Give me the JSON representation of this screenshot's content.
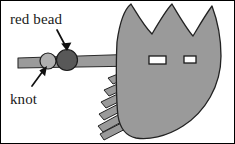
{
  "figure": {
    "type": "line-art-diagram",
    "width": 235,
    "height": 144,
    "background_color": "#ffffff",
    "border_color": "#000000"
  },
  "labels": {
    "red_bead": "red bead",
    "knot": "knot"
  },
  "colors": {
    "fan_fill": "#9a9a9a",
    "fan_stroke": "#222222",
    "shaft_fill": "#9b9b9b",
    "shaft_stroke": "#2a2a2a",
    "bead_fill": "#585858",
    "bead_stroke": "#1c1c1c",
    "knot_fill": "#b0b0b0",
    "knot_stroke": "#1c1c1c",
    "fringe_fill": "#9a9a9a",
    "fringe_stroke": "#242424",
    "slot_fill": "#ffffff",
    "slot_stroke": "#1a1a1a",
    "arrow_color": "#111111",
    "text_color": "#1a1a1a"
  },
  "parts": {
    "fan": {
      "name": "feathered fan body",
      "peak_count": 3
    },
    "shaft": {
      "name": "shaft",
      "from_x": 18,
      "to_x": 140
    },
    "bead": {
      "name": "red bead",
      "cx": 66,
      "cy": 61,
      "r": 10
    },
    "knot": {
      "name": "knot",
      "cx": 48,
      "cy": 61,
      "r": 8
    },
    "slots": [
      {
        "name": "large-slot",
        "x": 149,
        "y": 56,
        "w": 16,
        "h": 8
      },
      {
        "name": "small-slot",
        "x": 184,
        "y": 56,
        "w": 11,
        "h": 7
      }
    ],
    "fringe": {
      "name": "fringe strips",
      "count": 6
    }
  },
  "annotations": [
    {
      "id": "red-bead-annotation",
      "label_key": "red_bead",
      "label_x": 10,
      "label_y": 24,
      "arrow_from": {
        "x": 57,
        "y": 30
      },
      "arrow_to": {
        "x": 67,
        "y": 50
      }
    },
    {
      "id": "knot-annotation",
      "label_key": "knot",
      "label_x": 10,
      "label_y": 104,
      "arrow_from": {
        "x": 32,
        "y": 86
      },
      "arrow_to": {
        "x": 46,
        "y": 67
      }
    }
  ]
}
